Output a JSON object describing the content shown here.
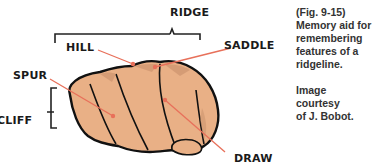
{
  "figure": {
    "labels": {
      "ridge": "RIDGE",
      "hill": "HILL",
      "saddle": "SADDLE",
      "spur": "SPUR",
      "cliff": "CLIFF",
      "draw": "DRAW"
    },
    "caption": {
      "line1": "(Fig. 9-15)",
      "line2": "Memory aid for",
      "line3": "remembering",
      "line4": "features of a",
      "line5": "ridgeline."
    },
    "credit": {
      "line1": "Image courtesy",
      "line2": "of J. Bobot."
    },
    "colors": {
      "skin": "#e9b086",
      "skin_shadow": "#c8906a",
      "outline": "#111111",
      "leader_line": "#e8705a",
      "text": "#1a1a1a"
    }
  }
}
